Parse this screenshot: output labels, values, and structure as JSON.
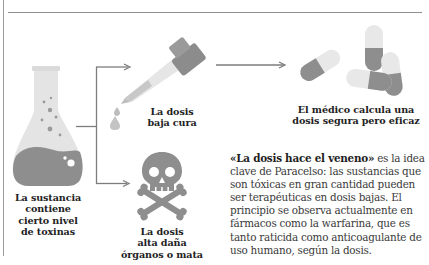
{
  "colors": {
    "dark_gray": "#8a8a8a",
    "mid_gray": "#a3a3a3",
    "light_gray": "#e2e2e2",
    "line_gray": "#7d7d7d",
    "text_dark": "#222222",
    "text_body": "#3a3a3a"
  },
  "flow": {
    "substance": {
      "icon": "flask-icon",
      "label_lines": [
        "La sustancia",
        "contiene",
        "cierto nivel",
        "de toxinas"
      ]
    },
    "low_dose": {
      "icon": "dropper-icon",
      "label_lines": [
        "La dosis",
        "baja cura"
      ]
    },
    "doctor": {
      "icon": "pills-icon",
      "label_lines": [
        "El médico calcula una",
        "dosis segura pero eficaz"
      ]
    },
    "high_dose": {
      "icon": "skull-crossbones-icon",
      "label_lines": [
        "La dosis",
        "alta daña",
        "órganos o mata"
      ]
    }
  },
  "paragraph": {
    "bold_quote": "«La dosis hace el veneno»",
    "rest": " es la idea clave de Paracelso: las sustancias que son tóxicas en gran cantidad pueden ser terapéuticas en dosis bajas. El principio se observa actualmente en fármacos como la warfarina, que es tanto raticida como anticoagulante de uso humano, según la dosis."
  }
}
